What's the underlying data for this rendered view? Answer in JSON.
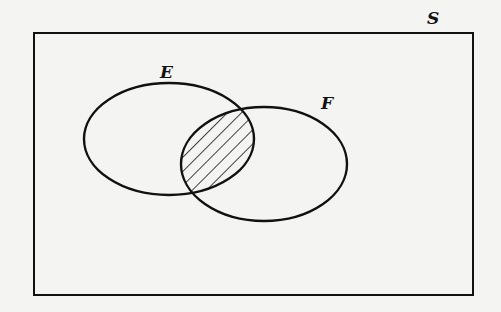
{
  "diagram": {
    "type": "venn",
    "universe_label": "S",
    "sets": [
      {
        "label": "E",
        "cx": 169,
        "cy": 139,
        "rx": 85,
        "ry": 56
      },
      {
        "label": "F",
        "cx": 264,
        "cy": 164,
        "rx": 83,
        "ry": 57
      }
    ],
    "shaded_region": "E ∩ F",
    "shading": "diagonal-hatch",
    "colors": {
      "line": "#111111",
      "background": "#f4f4f2"
    }
  }
}
